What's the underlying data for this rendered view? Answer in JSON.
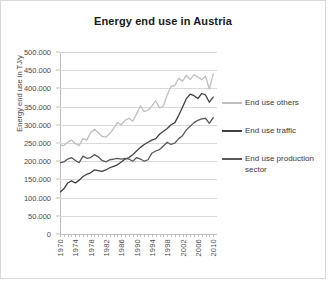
{
  "chart_data": {
    "type": "line",
    "title": "Energy end use in Austria",
    "xlabel": "",
    "ylabel": "Energy end use in TJ/y",
    "xlim": [
      1970,
      2011
    ],
    "ylim": [
      0,
      500000
    ],
    "ytick_step": 50000,
    "grid": true,
    "legend_position": "right",
    "x": [
      1970,
      1971,
      1972,
      1973,
      1974,
      1975,
      1976,
      1977,
      1978,
      1979,
      1980,
      1981,
      1982,
      1983,
      1984,
      1985,
      1986,
      1987,
      1988,
      1989,
      1990,
      1991,
      1992,
      1993,
      1994,
      1995,
      1996,
      1997,
      1998,
      1999,
      2000,
      2001,
      2002,
      2003,
      2004,
      2005,
      2006,
      2007,
      2008,
      2009,
      2010
    ],
    "ytick_labels": [
      "0",
      "50.000",
      "100.000",
      "150.000",
      "200.000",
      "250.000",
      "300.000",
      "350.000",
      "400.000",
      "450.000",
      "500.000"
    ],
    "ytick_values": [
      0,
      50000,
      100000,
      150000,
      200000,
      250000,
      300000,
      350000,
      400000,
      450000,
      500000
    ],
    "xtick_labels": [
      "1970",
      "1974",
      "1978",
      "1982",
      "1986",
      "1990",
      "1994",
      "1998",
      "2002",
      "2006",
      "2010"
    ],
    "xtick_values": [
      1970,
      1974,
      1978,
      1982,
      1986,
      1990,
      1994,
      1998,
      2002,
      2006,
      2010
    ],
    "series": [
      {
        "name": "End use others",
        "color": "#bfbfbf",
        "values": [
          245000,
          243000,
          252000,
          258000,
          248000,
          243000,
          262000,
          258000,
          278000,
          288000,
          278000,
          268000,
          266000,
          276000,
          290000,
          306000,
          300000,
          312000,
          318000,
          310000,
          330000,
          352000,
          336000,
          340000,
          352000,
          366000,
          346000,
          352000,
          382000,
          406000,
          408000,
          428000,
          420000,
          436000,
          424000,
          438000,
          432000,
          424000,
          434000,
          398000,
          440000
        ]
      },
      {
        "name": "End use traffic",
        "color": "#404040",
        "values": [
          115000,
          124000,
          140000,
          146000,
          140000,
          148000,
          158000,
          164000,
          168000,
          176000,
          174000,
          172000,
          176000,
          182000,
          186000,
          190000,
          198000,
          206000,
          210000,
          218000,
          228000,
          238000,
          246000,
          252000,
          258000,
          262000,
          274000,
          282000,
          290000,
          300000,
          306000,
          326000,
          348000,
          372000,
          384000,
          380000,
          372000,
          386000,
          382000,
          362000,
          376000
        ]
      },
      {
        "name": "End use production sector",
        "color": "#595959",
        "values": [
          196000,
          198000,
          206000,
          210000,
          202000,
          196000,
          214000,
          208000,
          210000,
          218000,
          212000,
          202000,
          198000,
          204000,
          206000,
          208000,
          206000,
          208000,
          206000,
          200000,
          210000,
          206000,
          200000,
          204000,
          222000,
          228000,
          232000,
          242000,
          252000,
          246000,
          250000,
          262000,
          270000,
          286000,
          296000,
          306000,
          312000,
          316000,
          318000,
          304000,
          320000
        ]
      }
    ]
  },
  "legend": {
    "items": [
      {
        "label": "End use others",
        "color": "#bfbfbf"
      },
      {
        "label": "End use traffic",
        "color": "#404040"
      },
      {
        "label": "End use production sector",
        "color": "#595959"
      }
    ]
  }
}
